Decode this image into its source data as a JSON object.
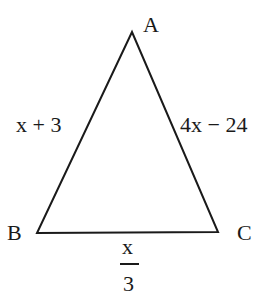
{
  "diagram": {
    "type": "triangle",
    "stroke_color": "#1a1a1a",
    "vertices": [
      {
        "name": "A",
        "x": 132,
        "y": 32
      },
      {
        "name": "B",
        "x": 37,
        "y": 233
      },
      {
        "name": "C",
        "x": 218,
        "y": 232
      }
    ],
    "vertex_labels": {
      "A": "A",
      "B": "B",
      "C": "C"
    },
    "side_labels": {
      "AB": "x + 3",
      "AC": "4x − 24",
      "BC_numerator": "x",
      "BC_denominator": "3"
    }
  }
}
